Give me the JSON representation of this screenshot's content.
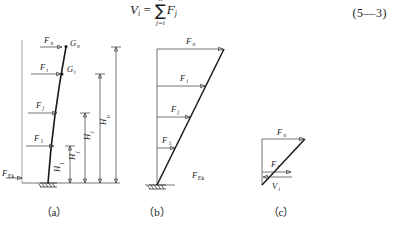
{
  "equation": {
    "lhs": "V",
    "lhs_sub": "i",
    "equals": "=",
    "sigma": "∑",
    "sigma_upper": "n",
    "sigma_lower": "j=i",
    "rhs": "F",
    "rhs_sub": "j",
    "number": "(5—3)"
  },
  "figures": [
    {
      "id": "a",
      "caption": "（a）",
      "description": "cantilever-with-lumped-masses",
      "force_labels": [
        {
          "name": "F",
          "sub": "n"
        },
        {
          "name": "F",
          "sub": "i"
        },
        {
          "name": "F",
          "sub": "j"
        },
        {
          "name": "F",
          "sub": "1"
        }
      ],
      "mass_labels": [
        {
          "name": "G",
          "sub": "n"
        },
        {
          "name": "G",
          "sub": "i"
        }
      ],
      "base_shear": {
        "name": "F",
        "sub": "Ek"
      },
      "height_labels": [
        {
          "name": "H",
          "sub": "1"
        },
        {
          "name": "H",
          "sub": "j"
        },
        {
          "name": "H",
          "sub": "i"
        },
        {
          "name": "H",
          "sub": "n"
        }
      ]
    },
    {
      "id": "b",
      "caption": "（b）",
      "description": "inverted-triangular-force-distribution",
      "force_labels": [
        {
          "name": "F",
          "sub": "n"
        },
        {
          "name": "F",
          "sub": "i"
        },
        {
          "name": "F",
          "sub": "j"
        },
        {
          "name": "F",
          "sub": "1"
        }
      ],
      "base_shear": {
        "name": "F",
        "sub": "Ek"
      }
    },
    {
      "id": "c",
      "caption": "（c）",
      "description": "free-body-shear-diagram",
      "force_labels": [
        {
          "name": "F",
          "sub": "n"
        },
        {
          "name": "F",
          "sub": "i"
        }
      ],
      "shear_label": {
        "name": "V",
        "sub": "i"
      }
    }
  ],
  "colors": {
    "ink": "#1a1a1a",
    "rule": "#3a3a3a",
    "thin_rule": "#7d7d7d",
    "page": "#ffffff"
  }
}
